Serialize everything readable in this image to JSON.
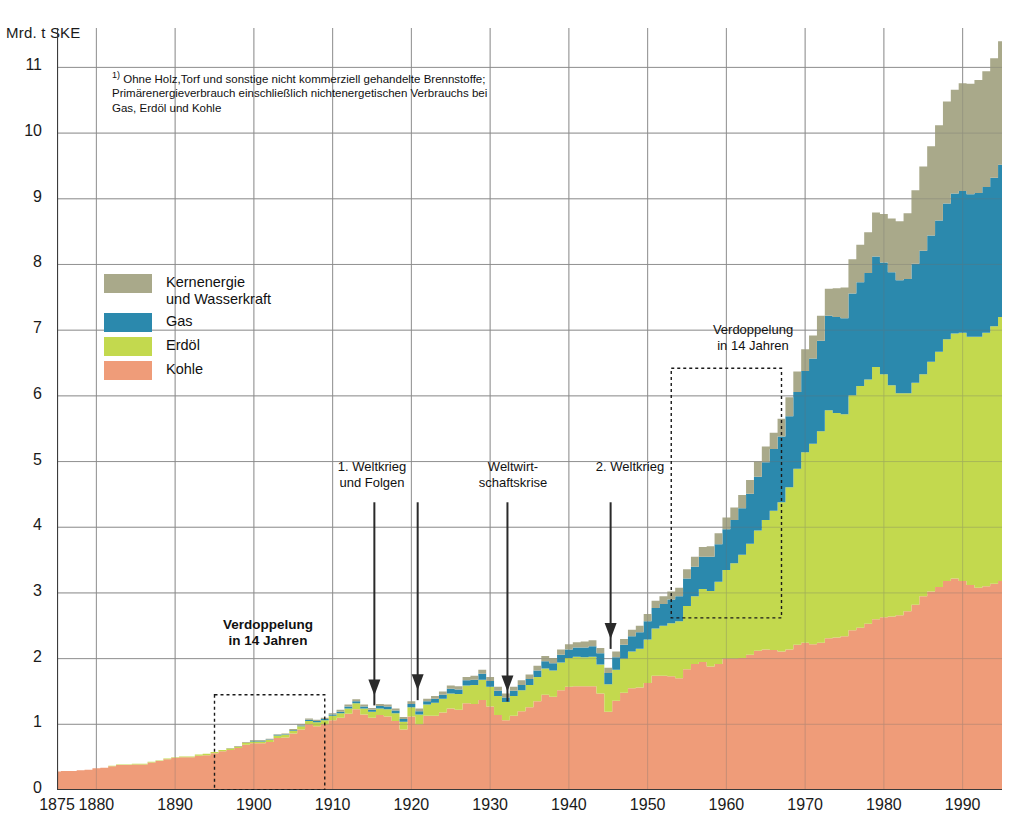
{
  "axis": {
    "y_unit": "Mrd. t SKE",
    "y_ticks": [
      "0",
      "1",
      "2",
      "3",
      "4",
      "5",
      "6",
      "7",
      "8",
      "9",
      "10",
      "11"
    ],
    "x_ticks": [
      "1875",
      "1880",
      "1890",
      "1900",
      "1910",
      "1920",
      "1930",
      "1940",
      "1950",
      "1960",
      "1970",
      "1980",
      "1990"
    ]
  },
  "footnote": {
    "marker": "1)",
    "line1": " Ohne Holz,Torf und sonstige nicht kommerziell gehandelte Brennstoffe;",
    "line2": "Primärenergieverbrauch einschließlich nichtenergetischen Verbrauchs bei",
    "line3": "Gas, Erdöl und Kohle"
  },
  "legend": {
    "items": [
      {
        "label_line1": "Kernenergie",
        "label_line2": "und Wasserkraft",
        "color": "#a9a98a"
      },
      {
        "label_line1": "Gas",
        "label_line2": "",
        "color": "#2b89ad"
      },
      {
        "label_line1": "Erdöl",
        "label_line2": "",
        "color": "#c3d94e"
      },
      {
        "label_line1": "Kohle",
        "label_line2": "",
        "color": "#ef9c79"
      }
    ]
  },
  "annotations": {
    "ww1": {
      "line1": "1. Weltkrieg",
      "line2": "und Folgen"
    },
    "depression": {
      "line1": "Weltwirt-",
      "line2": "schaftskrise"
    },
    "ww2": {
      "line1": "2. Weltkrieg",
      "line2": ""
    },
    "doubling_left": {
      "line1": "Verdoppelung",
      "line2": "in 14 Jahren"
    },
    "doubling_right": {
      "line1": "Verdoppelung",
      "line2": "in 14 Jahren"
    }
  },
  "chart_data": {
    "type": "area",
    "title": "",
    "subtitle": "",
    "xlabel": "",
    "ylabel": "Mrd. t SKE",
    "xlim": [
      1875,
      1995
    ],
    "ylim": [
      0,
      11.6
    ],
    "grid": true,
    "legend_position": "inside-left",
    "stacked": true,
    "stack_order_bottom_to_top": [
      "Kohle",
      "Erdöl",
      "Gas",
      "Kernenergie und Wasserkraft"
    ],
    "colors": {
      "Kohle": "#ef9c79",
      "Erdöl": "#c3d94e",
      "Gas": "#2b89ad",
      "Kernenergie und Wasserkraft": "#a9a98a"
    },
    "x": [
      1875,
      1876,
      1877,
      1878,
      1879,
      1880,
      1881,
      1882,
      1883,
      1884,
      1885,
      1886,
      1887,
      1888,
      1889,
      1890,
      1891,
      1892,
      1893,
      1894,
      1895,
      1896,
      1897,
      1898,
      1899,
      1900,
      1901,
      1902,
      1903,
      1904,
      1905,
      1906,
      1907,
      1908,
      1909,
      1910,
      1911,
      1912,
      1913,
      1914,
      1915,
      1916,
      1917,
      1918,
      1919,
      1920,
      1921,
      1922,
      1923,
      1924,
      1925,
      1926,
      1927,
      1928,
      1929,
      1930,
      1931,
      1932,
      1933,
      1934,
      1935,
      1936,
      1937,
      1938,
      1939,
      1940,
      1941,
      1942,
      1943,
      1944,
      1945,
      1946,
      1947,
      1948,
      1949,
      1950,
      1951,
      1952,
      1953,
      1954,
      1955,
      1956,
      1957,
      1958,
      1959,
      1960,
      1961,
      1962,
      1963,
      1964,
      1965,
      1966,
      1967,
      1968,
      1969,
      1970,
      1971,
      1972,
      1973,
      1974,
      1975,
      1976,
      1977,
      1978,
      1979,
      1980,
      1981,
      1982,
      1983,
      1984,
      1985,
      1986,
      1987,
      1988,
      1989,
      1990,
      1991,
      1992,
      1993,
      1994,
      1995
    ],
    "series": [
      {
        "name": "Kohle",
        "values": [
          0.28,
          0.29,
          0.29,
          0.3,
          0.31,
          0.33,
          0.34,
          0.36,
          0.38,
          0.38,
          0.39,
          0.39,
          0.42,
          0.44,
          0.47,
          0.49,
          0.5,
          0.5,
          0.52,
          0.53,
          0.56,
          0.59,
          0.61,
          0.64,
          0.69,
          0.71,
          0.71,
          0.73,
          0.79,
          0.8,
          0.86,
          0.92,
          1.0,
          0.97,
          1.0,
          1.06,
          1.1,
          1.16,
          1.23,
          1.15,
          1.1,
          1.14,
          1.12,
          1.05,
          0.92,
          1.12,
          1.0,
          1.13,
          1.13,
          1.18,
          1.24,
          1.22,
          1.32,
          1.31,
          1.37,
          1.27,
          1.14,
          1.06,
          1.13,
          1.2,
          1.26,
          1.35,
          1.45,
          1.42,
          1.52,
          1.57,
          1.58,
          1.58,
          1.58,
          1.47,
          1.19,
          1.36,
          1.48,
          1.55,
          1.56,
          1.63,
          1.74,
          1.74,
          1.73,
          1.7,
          1.84,
          1.92,
          1.95,
          1.88,
          1.92,
          2.0,
          2.0,
          2.01,
          2.06,
          2.12,
          2.14,
          2.13,
          2.11,
          2.14,
          2.21,
          2.24,
          2.22,
          2.24,
          2.31,
          2.32,
          2.34,
          2.43,
          2.47,
          2.53,
          2.6,
          2.63,
          2.64,
          2.66,
          2.72,
          2.82,
          2.95,
          3.02,
          3.09,
          3.18,
          3.22,
          3.18,
          3.12,
          3.08,
          3.1,
          3.14,
          3.18
        ]
      },
      {
        "name": "Erdöl",
        "values": [
          0.0,
          0.0,
          0.0,
          0.0,
          0.0,
          0.0,
          0.0,
          0.01,
          0.01,
          0.01,
          0.01,
          0.01,
          0.01,
          0.01,
          0.01,
          0.01,
          0.01,
          0.01,
          0.02,
          0.02,
          0.02,
          0.02,
          0.02,
          0.02,
          0.03,
          0.03,
          0.03,
          0.03,
          0.04,
          0.04,
          0.04,
          0.05,
          0.05,
          0.06,
          0.06,
          0.07,
          0.07,
          0.08,
          0.09,
          0.09,
          0.09,
          0.1,
          0.11,
          0.12,
          0.12,
          0.14,
          0.15,
          0.17,
          0.2,
          0.21,
          0.23,
          0.24,
          0.27,
          0.29,
          0.31,
          0.3,
          0.29,
          0.28,
          0.3,
          0.32,
          0.34,
          0.37,
          0.4,
          0.4,
          0.42,
          0.44,
          0.45,
          0.44,
          0.45,
          0.44,
          0.42,
          0.47,
          0.52,
          0.56,
          0.59,
          0.66,
          0.72,
          0.76,
          0.81,
          0.87,
          0.96,
          1.03,
          1.11,
          1.15,
          1.25,
          1.35,
          1.45,
          1.57,
          1.69,
          1.83,
          1.97,
          2.12,
          2.27,
          2.47,
          2.68,
          2.9,
          3.05,
          3.22,
          3.47,
          3.42,
          3.38,
          3.58,
          3.68,
          3.72,
          3.84,
          3.7,
          3.52,
          3.38,
          3.32,
          3.38,
          3.38,
          3.5,
          3.58,
          3.68,
          3.73,
          3.78,
          3.78,
          3.82,
          3.86,
          3.92,
          4.02
        ]
      },
      {
        "name": "Gas",
        "values": [
          0.0,
          0.0,
          0.0,
          0.0,
          0.0,
          0.0,
          0.0,
          0.0,
          0.0,
          0.0,
          0.0,
          0.0,
          0.0,
          0.0,
          0.0,
          0.0,
          0.0,
          0.0,
          0.0,
          0.0,
          0.0,
          0.0,
          0.0,
          0.0,
          0.0,
          0.01,
          0.01,
          0.01,
          0.01,
          0.01,
          0.01,
          0.01,
          0.02,
          0.02,
          0.02,
          0.02,
          0.02,
          0.03,
          0.03,
          0.03,
          0.03,
          0.04,
          0.04,
          0.04,
          0.04,
          0.05,
          0.05,
          0.05,
          0.06,
          0.06,
          0.07,
          0.07,
          0.08,
          0.08,
          0.09,
          0.09,
          0.08,
          0.07,
          0.08,
          0.08,
          0.09,
          0.1,
          0.11,
          0.11,
          0.12,
          0.13,
          0.14,
          0.15,
          0.16,
          0.17,
          0.17,
          0.19,
          0.21,
          0.23,
          0.25,
          0.28,
          0.31,
          0.33,
          0.36,
          0.38,
          0.42,
          0.45,
          0.49,
          0.52,
          0.57,
          0.62,
          0.66,
          0.71,
          0.76,
          0.82,
          0.88,
          0.94,
          1.0,
          1.08,
          1.17,
          1.24,
          1.3,
          1.38,
          1.44,
          1.46,
          1.46,
          1.55,
          1.58,
          1.62,
          1.68,
          1.7,
          1.72,
          1.72,
          1.74,
          1.81,
          1.88,
          1.92,
          2.0,
          2.07,
          2.13,
          2.16,
          2.17,
          2.19,
          2.22,
          2.26,
          2.32
        ]
      },
      {
        "name": "Kernenergie und Wasserkraft",
        "values": [
          0.0,
          0.0,
          0.0,
          0.0,
          0.0,
          0.0,
          0.0,
          0.0,
          0.0,
          0.0,
          0.0,
          0.0,
          0.0,
          0.0,
          0.0,
          0.0,
          0.0,
          0.0,
          0.0,
          0.0,
          0.0,
          0.0,
          0.01,
          0.01,
          0.01,
          0.01,
          0.01,
          0.01,
          0.01,
          0.01,
          0.02,
          0.02,
          0.02,
          0.02,
          0.02,
          0.02,
          0.03,
          0.03,
          0.03,
          0.03,
          0.03,
          0.03,
          0.03,
          0.03,
          0.03,
          0.04,
          0.04,
          0.04,
          0.04,
          0.05,
          0.05,
          0.05,
          0.05,
          0.06,
          0.06,
          0.06,
          0.06,
          0.06,
          0.06,
          0.07,
          0.07,
          0.07,
          0.08,
          0.08,
          0.08,
          0.08,
          0.08,
          0.09,
          0.09,
          0.08,
          0.08,
          0.09,
          0.09,
          0.1,
          0.1,
          0.11,
          0.11,
          0.12,
          0.12,
          0.13,
          0.14,
          0.15,
          0.15,
          0.16,
          0.17,
          0.18,
          0.19,
          0.2,
          0.21,
          0.23,
          0.24,
          0.25,
          0.27,
          0.29,
          0.31,
          0.33,
          0.35,
          0.38,
          0.41,
          0.44,
          0.47,
          0.52,
          0.57,
          0.62,
          0.67,
          0.74,
          0.82,
          0.9,
          1.0,
          1.12,
          1.28,
          1.36,
          1.45,
          1.55,
          1.58,
          1.64,
          1.68,
          1.72,
          1.76,
          1.82,
          1.88
        ]
      }
    ]
  }
}
